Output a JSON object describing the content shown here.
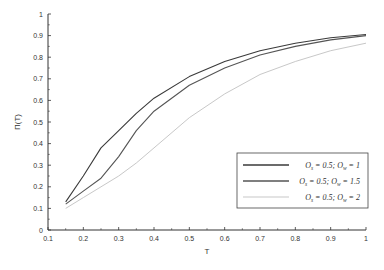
{
  "chart_data": {
    "type": "line",
    "title": "",
    "xlabel": "T",
    "ylabel": "Π(T)",
    "xlim": [
      0.1,
      1
    ],
    "ylim": [
      0,
      1
    ],
    "grid": false,
    "legend_position": "lower right",
    "xticks": [
      "0.1",
      "0.2",
      "0.3",
      "0.4",
      "0.5",
      "0.6",
      "0.7",
      "0.8",
      "0.9",
      "1"
    ],
    "yticks": [
      "0",
      "0.1",
      "0.2",
      "0.3",
      "0.4",
      "0.5",
      "0.6",
      "0.7",
      "0.8",
      "0.9",
      "1"
    ],
    "x": [
      0.15,
      0.2,
      0.25,
      0.3,
      0.35,
      0.4,
      0.5,
      0.6,
      0.7,
      0.8,
      0.9,
      1.0
    ],
    "series": [
      {
        "name": "O_s = 0.5; O_w = 1",
        "label_main": "O",
        "sub1": "s",
        "mid": " = 0.5; O",
        "sub2": "w",
        "tail": " = 1",
        "color": "#3a3a3a",
        "width": 1.1,
        "values": [
          0.13,
          0.25,
          0.38,
          0.46,
          0.54,
          0.61,
          0.71,
          0.78,
          0.83,
          0.865,
          0.89,
          0.905
        ]
      },
      {
        "name": "O_s = 0.5; O_w = 1.5",
        "label_main": "O",
        "sub1": "s",
        "mid": " = 0.5; O",
        "sub2": "w",
        "tail": " = 1.5",
        "color": "#555555",
        "width": 1.1,
        "values": [
          0.12,
          0.18,
          0.24,
          0.34,
          0.46,
          0.55,
          0.67,
          0.75,
          0.81,
          0.85,
          0.88,
          0.9
        ]
      },
      {
        "name": "O_s = 0.5; O_w = 2",
        "label_main": "O",
        "sub1": "s",
        "mid": " = 0.5; O",
        "sub2": "w",
        "tail": " = 2",
        "color": "#c8c8c8",
        "width": 1.0,
        "values": [
          0.1,
          0.15,
          0.2,
          0.25,
          0.31,
          0.38,
          0.52,
          0.63,
          0.72,
          0.78,
          0.83,
          0.865
        ]
      }
    ]
  }
}
